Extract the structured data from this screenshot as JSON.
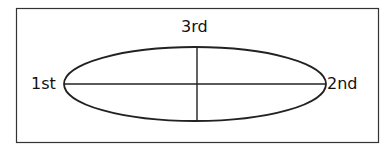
{
  "diagram": {
    "labels": {
      "first": "1st",
      "second": "2nd",
      "third": "3rd"
    },
    "colors": {
      "stroke": "#222222",
      "background": "#ffffff"
    }
  }
}
